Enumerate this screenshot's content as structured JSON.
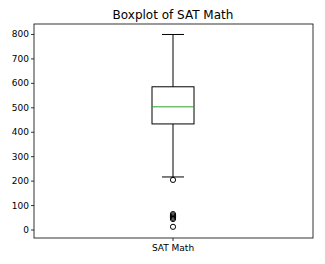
{
  "chart_data": {
    "type": "boxplot",
    "title": "Boxplot of SAT Math",
    "xlabel": "",
    "ylabel": "",
    "categories": [
      "SAT Math"
    ],
    "ylim": [
      -25,
      840
    ],
    "yticks": [
      0,
      100,
      200,
      300,
      400,
      500,
      600,
      700,
      800
    ],
    "grid": false,
    "legend": null,
    "series": [
      {
        "name": "SAT Math",
        "whisker_low": 217,
        "q1": 434,
        "median": 504,
        "q3": 586,
        "whisker_high": 800,
        "outliers": [
          205,
          65,
          60,
          55,
          50,
          45,
          13
        ]
      }
    ],
    "colors": {
      "box": "#000000",
      "median": "#2ca02c",
      "axes": "#000000"
    }
  }
}
